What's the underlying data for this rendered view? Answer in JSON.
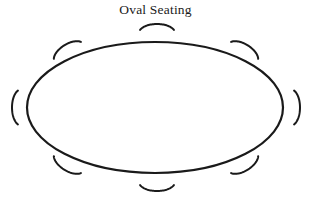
{
  "diagram": {
    "title": "Oval Seating",
    "type": "seating-chart",
    "canvas": {
      "width": 311,
      "height": 203
    },
    "background_color": "#ffffff",
    "stroke_color": "#1a1a1a",
    "title_color": "#1a1a1a",
    "table": {
      "label": "oval-table",
      "shape": "ellipse",
      "center_x": 155,
      "center_y": 107.5,
      "radius_x": 128,
      "radius_y": 65.5,
      "stroke_width": 2.2,
      "fill": "#ffffff"
    },
    "chair_count": 8,
    "chairs": [
      {
        "label": "chair-top-center",
        "position": "top-center",
        "cx": 157,
        "cy": 33,
        "rx": 18,
        "ry": 9,
        "rotation": 0,
        "stroke_width": 2.0,
        "sweep_start": 200,
        "sweep_end": 340
      },
      {
        "label": "chair-top-left",
        "position": "top-left",
        "cx": 69,
        "cy": 53,
        "rx": 17,
        "ry": 9,
        "rotation": -32,
        "stroke_width": 2.0,
        "sweep_start": 200,
        "sweep_end": 340
      },
      {
        "label": "chair-top-right",
        "position": "top-right",
        "cx": 243,
        "cy": 53,
        "rx": 17,
        "ry": 9,
        "rotation": 32,
        "stroke_width": 2.0,
        "sweep_start": 200,
        "sweep_end": 340
      },
      {
        "label": "chair-left",
        "position": "left",
        "cx": 21,
        "cy": 107.5,
        "rx": 9,
        "ry": 18,
        "rotation": 0,
        "stroke_width": 2.0,
        "sweep_start": 110,
        "sweep_end": 250
      },
      {
        "label": "chair-right",
        "position": "right",
        "cx": 291,
        "cy": 107.5,
        "rx": 9,
        "ry": 18,
        "rotation": 0,
        "stroke_width": 2.0,
        "sweep_start": -70,
        "sweep_end": 70
      },
      {
        "label": "chair-bottom-left",
        "position": "bottom-left",
        "cx": 69,
        "cy": 162,
        "rx": 17,
        "ry": 9,
        "rotation": 32,
        "stroke_width": 2.0,
        "sweep_start": 20,
        "sweep_end": 160
      },
      {
        "label": "chair-bottom-center",
        "position": "bottom-center",
        "cx": 157,
        "cy": 182,
        "rx": 18,
        "ry": 9,
        "rotation": 0,
        "stroke_width": 2.0,
        "sweep_start": 20,
        "sweep_end": 160
      },
      {
        "label": "chair-bottom-right",
        "position": "bottom-right",
        "cx": 243,
        "cy": 162,
        "rx": 17,
        "ry": 9,
        "rotation": -32,
        "stroke_width": 2.0,
        "sweep_start": 20,
        "sweep_end": 160
      }
    ]
  }
}
